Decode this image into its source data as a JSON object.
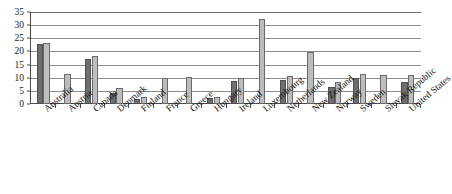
{
  "chart_data": {
    "type": "bar",
    "title": "",
    "subtitle": "",
    "xlabel": "",
    "ylabel": "",
    "ylim": [
      0,
      35
    ],
    "yticks": [
      0,
      5,
      10,
      15,
      20,
      25,
      30,
      35
    ],
    "grid": true,
    "legend_position": "none",
    "categories": [
      "Australia",
      "Austria",
      "Canada",
      "Denmark",
      "Finland",
      "France",
      "Greece",
      "Hungary",
      "Ireland",
      "Luxembourg",
      "Netherlands",
      "New Zealand",
      "Norway",
      "Sweden",
      "Slovak Republic",
      "United States"
    ],
    "series": [
      {
        "name": "Series 1",
        "color": "#6e6e6e",
        "values": [
          22.7,
          null,
          17.2,
          4.2,
          1.8,
          null,
          null,
          2.2,
          8.8,
          null,
          9.3,
          null,
          6.3,
          9.8,
          null,
          8.5
        ]
      },
      {
        "name": "Series 2",
        "color": "#bdbdbd",
        "values": [
          23.2,
          11.5,
          18.2,
          6.0,
          2.8,
          10.0,
          10.2,
          2.8,
          9.8,
          32.5,
          10.5,
          19.8,
          8.2,
          11.3,
          11.2,
          11.0
        ]
      }
    ]
  },
  "axes": {
    "y_tick_labels": [
      "0",
      "5",
      "10",
      "15",
      "20",
      "25",
      "30",
      "35"
    ]
  },
  "colors": {
    "series1": "#6e6e6e",
    "series2": "#bdbdbd",
    "gridline": "#8d8d8d",
    "axis": "#4a4a4a",
    "text": "#141414",
    "background": "#ffffff"
  }
}
